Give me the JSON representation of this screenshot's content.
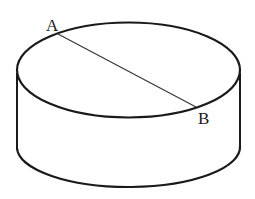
{
  "diagram": {
    "type": "geometry-figure",
    "colors": {
      "background": "#ffffff",
      "stroke": "#1a1a1a"
    },
    "points": [
      {
        "id": "A",
        "label": "A"
      },
      {
        "id": "B",
        "label": "B"
      }
    ],
    "segments": [
      {
        "from": "A",
        "to": "B"
      }
    ]
  }
}
